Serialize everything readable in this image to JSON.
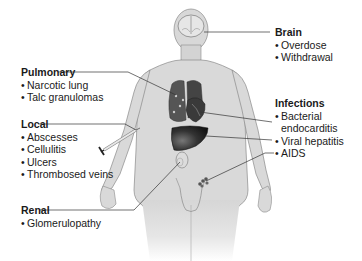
{
  "diagram": {
    "groups": {
      "brain": {
        "title": "Brain",
        "items": [
          "Overdose",
          "Withdrawal"
        ]
      },
      "pulmonary": {
        "title": "Pulmonary",
        "items": [
          "Narcotic lung",
          "Talc granulomas"
        ]
      },
      "infections": {
        "title": "Infections",
        "items": [
          "Bacterial",
          "endocarditis",
          "Viral hepatitis",
          "AIDS"
        ]
      },
      "local": {
        "title": "Local",
        "items": [
          "Abscesses",
          "Cellulitis",
          "Ulcers",
          "Thrombosed veins"
        ]
      },
      "renal": {
        "title": "Renal",
        "items": [
          "Glomerulopathy"
        ]
      }
    },
    "bullet": "•",
    "icons": [
      "human-body-figure",
      "brain-icon",
      "lungs-icon",
      "heart-icon",
      "liver-icon",
      "kidney-icon",
      "lymph-nodes-icon",
      "syringe-icon"
    ],
    "colors": {
      "skin": "#d9d9d9",
      "outline": "#8a8a8a",
      "organ_dark": "#2a2a2a",
      "leader_line": "#333333",
      "text": "#1a1a1a"
    }
  }
}
